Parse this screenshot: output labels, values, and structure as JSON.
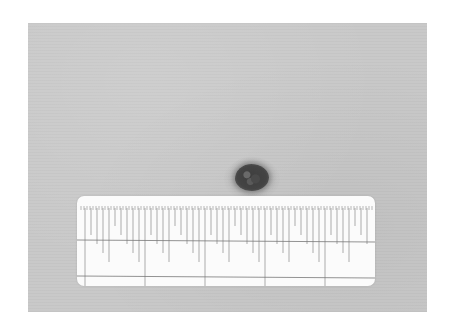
{
  "image": {
    "description": "Grayscale clinical photograph of a small dark pigmented skin lesion with a measurement ruler below it",
    "background_color": "#c9c9c9",
    "lesion": {
      "color": "#444444",
      "center_x": 224,
      "center_y": 154,
      "width_px": 34,
      "height_px": 27
    },
    "ruler": {
      "color": "#fbfbfb",
      "tick_color": "#8a8a8a",
      "labels": []
    }
  }
}
